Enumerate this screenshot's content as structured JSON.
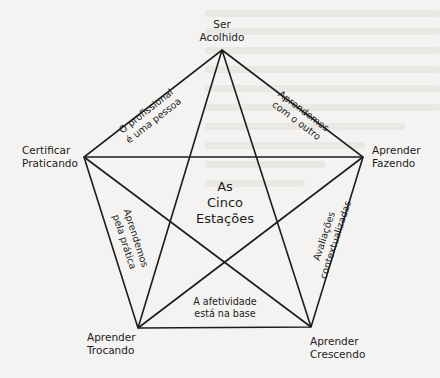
{
  "diagram": {
    "type": "pentagram",
    "title_lines": [
      "As",
      "Cinco",
      "Estações"
    ],
    "colors": {
      "background": "#f4f3f1",
      "line": "#1c1c1c",
      "text": "#1c1c1c"
    },
    "vertices": [
      {
        "id": "ser-acolhido",
        "lines": [
          "Ser",
          "Acolhido"
        ],
        "x": 222,
        "y": 50
      },
      {
        "id": "aprender-fazendo",
        "lines": [
          "Aprender",
          "Fazendo"
        ],
        "x": 363,
        "y": 157
      },
      {
        "id": "aprender-crescendo",
        "lines": [
          "Aprender",
          "Crescendo"
        ],
        "x": 311,
        "y": 327
      },
      {
        "id": "aprender-trocando",
        "lines": [
          "Aprender",
          "Trocando"
        ],
        "x": 138,
        "y": 328
      },
      {
        "id": "certificar-praticando",
        "lines": [
          "Certificar",
          "Praticando"
        ],
        "x": 84,
        "y": 157
      }
    ],
    "edge_labels": [
      {
        "id": "top-left",
        "between": [
          "certificar-praticando",
          "ser-acolhido"
        ],
        "lines": [
          "O profissional",
          "é uma pessoa"
        ]
      },
      {
        "id": "top-right",
        "between": [
          "ser-acolhido",
          "aprender-fazendo"
        ],
        "lines": [
          "Aprendemos",
          "com o outro"
        ]
      },
      {
        "id": "right",
        "between": [
          "aprender-fazendo",
          "aprender-crescendo"
        ],
        "lines": [
          "Avaliações",
          "contextualizadas"
        ]
      },
      {
        "id": "bottom",
        "between": [
          "aprender-trocando",
          "aprender-crescendo"
        ],
        "lines": [
          "A afetividade",
          "está na base"
        ]
      },
      {
        "id": "left",
        "between": [
          "certificar-praticando",
          "aprender-trocando"
        ],
        "lines": [
          "Aprendemos",
          "pela prática"
        ]
      }
    ]
  }
}
